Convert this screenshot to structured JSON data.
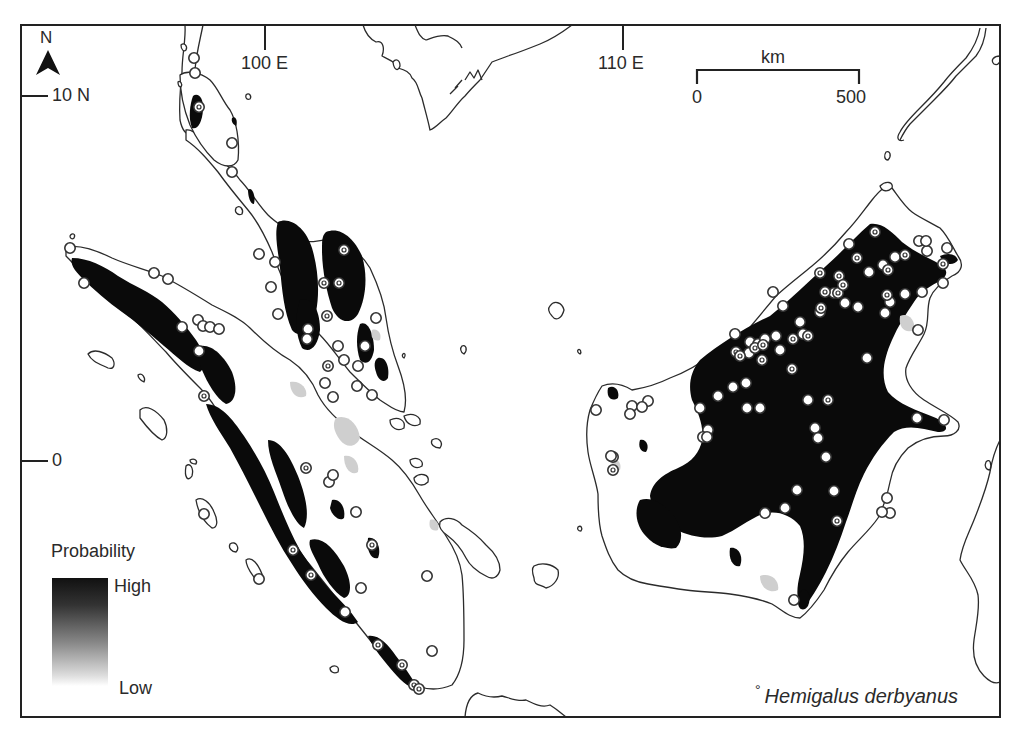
{
  "figure": {
    "type": "species distribution probability map",
    "region": "Sundaland (Malay Peninsula, Sumatra, Borneo)",
    "colors": {
      "high_probability": "#0a0a0a",
      "low_probability": "#ffffff",
      "coastline": "#2b2b2b",
      "frame": "#222222"
    }
  },
  "north_arrow": {
    "label": "N",
    "icon": "north-arrow-icon"
  },
  "graticule": {
    "latitude_labels": [
      "10 N",
      "0"
    ],
    "longitude_labels": [
      "100 E",
      "110 E"
    ]
  },
  "scale_bar": {
    "unit": "km",
    "start": "0",
    "end": "500"
  },
  "legend": {
    "title": "Probability",
    "high": "High",
    "low": "Low"
  },
  "species": {
    "marker": "°",
    "name": "Hemigalus derbyanus"
  },
  "occurrence_points": {
    "open": [
      [
        194,
        58
      ],
      [
        195,
        73
      ],
      [
        232,
        143
      ],
      [
        232,
        172
      ],
      [
        259,
        254
      ],
      [
        275,
        262
      ],
      [
        271,
        287
      ],
      [
        278,
        314
      ],
      [
        308,
        329
      ],
      [
        307,
        339
      ],
      [
        338,
        346
      ],
      [
        333,
        397
      ],
      [
        325,
        383
      ],
      [
        376,
        318
      ],
      [
        358,
        366
      ],
      [
        344,
        360
      ],
      [
        372,
        395
      ],
      [
        365,
        346
      ],
      [
        70,
        248
      ],
      [
        84,
        283
      ],
      [
        154,
        273
      ],
      [
        168,
        279
      ],
      [
        198,
        320
      ],
      [
        203,
        326
      ],
      [
        210,
        327
      ],
      [
        219,
        329
      ],
      [
        182,
        327
      ],
      [
        199,
        351
      ],
      [
        357,
        386
      ],
      [
        329,
        482
      ],
      [
        333,
        475
      ],
      [
        356,
        512
      ],
      [
        204,
        514
      ],
      [
        259,
        579
      ],
      [
        361,
        588
      ],
      [
        345,
        612
      ],
      [
        427,
        576
      ],
      [
        432,
        651
      ],
      [
        773,
        292
      ],
      [
        783,
        306
      ],
      [
        800,
        322
      ],
      [
        820,
        312
      ],
      [
        845,
        303
      ],
      [
        858,
        307
      ],
      [
        869,
        272
      ],
      [
        883,
        265
      ],
      [
        895,
        257
      ],
      [
        919,
        241
      ],
      [
        927,
        251
      ],
      [
        926,
        241
      ],
      [
        947,
        248
      ],
      [
        905,
        294
      ],
      [
        922,
        292
      ],
      [
        943,
        283
      ],
      [
        918,
        330
      ],
      [
        885,
        313
      ],
      [
        890,
        302
      ],
      [
        735,
        334
      ],
      [
        750,
        342
      ],
      [
        758,
        344
      ],
      [
        765,
        339
      ],
      [
        776,
        336
      ],
      [
        803,
        334
      ],
      [
        780,
        350
      ],
      [
        749,
        353
      ],
      [
        746,
        383
      ],
      [
        718,
        396
      ],
      [
        733,
        387
      ],
      [
        700,
        408
      ],
      [
        747,
        408
      ],
      [
        760,
        408
      ],
      [
        808,
        400
      ],
      [
        867,
        358
      ],
      [
        917,
        418
      ],
      [
        815,
        428
      ],
      [
        818,
        438
      ],
      [
        826,
        457
      ],
      [
        797,
        490
      ],
      [
        765,
        513
      ],
      [
        834,
        491
      ],
      [
        785,
        508
      ],
      [
        887,
        498
      ],
      [
        890,
        513
      ],
      [
        882,
        512
      ],
      [
        708,
        430
      ],
      [
        703,
        437
      ],
      [
        632,
        406
      ],
      [
        630,
        414
      ],
      [
        596,
        410
      ],
      [
        613,
        457
      ],
      [
        648,
        401
      ],
      [
        707,
        437
      ],
      [
        642,
        407
      ],
      [
        611,
        456
      ],
      [
        794,
        600
      ],
      [
        944,
        420
      ],
      [
        849,
        244
      ],
      [
        834,
        293
      ]
    ],
    "ringed": [
      [
        199,
        107
      ],
      [
        344,
        250
      ],
      [
        324,
        283
      ],
      [
        339,
        283
      ],
      [
        327,
        316
      ],
      [
        328,
        366
      ],
      [
        204,
        396
      ],
      [
        306,
        468
      ],
      [
        372,
        545
      ],
      [
        293,
        550
      ],
      [
        311,
        575
      ],
      [
        378,
        645
      ],
      [
        402,
        665
      ],
      [
        414,
        685
      ],
      [
        419,
        689
      ],
      [
        875,
        232
      ],
      [
        888,
        270
      ],
      [
        905,
        255
      ],
      [
        887,
        295
      ],
      [
        857,
        258
      ],
      [
        839,
        276
      ],
      [
        820,
        273
      ],
      [
        825,
        292
      ],
      [
        838,
        293
      ],
      [
        843,
        285
      ],
      [
        821,
        308
      ],
      [
        808,
        336
      ],
      [
        793,
        339
      ],
      [
        755,
        348
      ],
      [
        763,
        345
      ],
      [
        792,
        369
      ],
      [
        736,
        352
      ],
      [
        740,
        356
      ],
      [
        762,
        360
      ],
      [
        828,
        400
      ],
      [
        837,
        521
      ],
      [
        943,
        264
      ],
      [
        613,
        470
      ]
    ]
  }
}
